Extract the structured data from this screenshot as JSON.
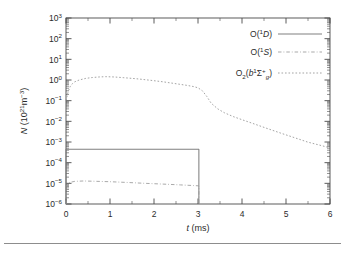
{
  "figure": {
    "background": "#ffffff",
    "frame_color": "#4a4a4a"
  },
  "axes": {
    "x": {
      "label_var": "t",
      "label_unit": "(ms)",
      "min": 0,
      "max": 6,
      "ticks": [
        "0",
        "1",
        "2",
        "3",
        "4",
        "5",
        "6"
      ],
      "scale": "linear"
    },
    "y": {
      "label_var": "N",
      "label_unit": "(10",
      "label_unit_exp": "21",
      "label_unit_m": "m",
      "label_unit_m_exp": "−3",
      "label_unit_close": ")",
      "min_exp": -6,
      "max_exp": 3,
      "ticks": [
        "-6",
        "-5",
        "-4",
        "-3",
        "-2",
        "-1",
        "0",
        "1",
        "2",
        "3"
      ],
      "base": "10",
      "scale": "log"
    }
  },
  "legend": {
    "position": "top-right",
    "entries": [
      {
        "label_main": "O(",
        "label_sup": "1",
        "label_term": "D",
        "label_close": ")",
        "style": "solid",
        "color": "#808080"
      },
      {
        "label_main": "O(",
        "label_sup": "1",
        "label_term": "S",
        "label_close": ")",
        "style": "dashdot",
        "color": "#9a9a9a"
      },
      {
        "label_main": "O",
        "label_sub": "2",
        "label_paren": "(",
        "label_b": "b",
        "label_sup": "1",
        "label_sigma": "Σ",
        "label_sigma_sup": "+",
        "label_sigma_sub": "g",
        "label_close": ")",
        "style": "dotted",
        "color": "#9a9a9a"
      }
    ]
  },
  "chart_data": {
    "type": "line",
    "title": "",
    "xlabel": "t (ms)",
    "ylabel": "N (10^21 m^-3)",
    "xlim": [
      0,
      6
    ],
    "ylim": [
      1e-06,
      1000
    ],
    "yscale": "log",
    "grid": false,
    "legend_position": "top-right",
    "series": [
      {
        "name": "O(1D)",
        "style": "solid",
        "color": "#808080",
        "x": [
          0,
          0,
          0.3,
          0.6,
          0.9,
          1.2,
          1.5,
          1.8,
          2.1,
          2.4,
          2.7,
          2.95,
          3.0,
          3.02,
          3.02
        ],
        "y": [
          1e-06,
          0.00045,
          0.00045,
          0.00045,
          0.00045,
          0.00045,
          0.00045,
          0.00045,
          0.00045,
          0.00045,
          0.00045,
          0.00045,
          0.00045,
          0.00045,
          1e-06
        ]
      },
      {
        "name": "O(1S)",
        "style": "dashdot",
        "color": "#9a9a9a",
        "x": [
          0,
          0,
          0.08,
          0.2,
          0.4,
          0.7,
          1.0,
          1.4,
          1.8,
          2.2,
          2.6,
          2.9,
          3.0,
          3.02,
          3.02
        ],
        "y": [
          1e-06,
          7e-06,
          1.1e-05,
          1.25e-05,
          1.3e-05,
          1.25e-05,
          1.2e-05,
          1.1e-05,
          1e-05,
          9.2e-06,
          8.4e-06,
          7.8e-06,
          7.6e-06,
          7.5e-06,
          1e-06
        ]
      },
      {
        "name": "O2(b1Sigma+g)",
        "style": "dotted",
        "color": "#9a9a9a",
        "x": [
          0,
          0.05,
          0.1,
          0.15,
          0.2,
          0.3,
          0.45,
          0.6,
          0.75,
          0.9,
          1.1,
          1.3,
          1.6,
          1.9,
          2.2,
          2.5,
          2.75,
          2.9,
          3.0,
          3.1,
          3.2,
          3.3,
          3.45,
          3.6,
          3.8,
          4.0,
          4.3,
          4.6,
          4.9,
          5.2,
          5.5,
          5.75,
          6.0
        ],
        "y": [
          0.1,
          0.28,
          0.5,
          0.68,
          0.82,
          1.0,
          1.2,
          1.32,
          1.4,
          1.45,
          1.4,
          1.3,
          1.15,
          0.98,
          0.82,
          0.66,
          0.55,
          0.48,
          0.42,
          0.3,
          0.16,
          0.075,
          0.04,
          0.026,
          0.017,
          0.012,
          0.0072,
          0.0043,
          0.0026,
          0.0016,
          0.00098,
          0.00072,
          0.00052
        ]
      }
    ]
  }
}
